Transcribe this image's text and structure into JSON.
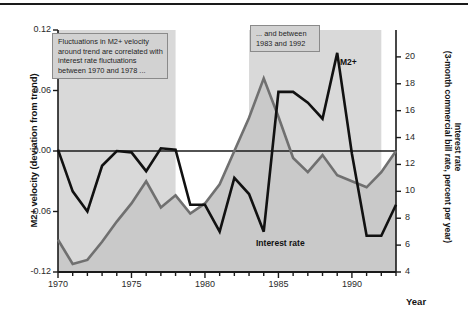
{
  "figure": {
    "x_axis_title": "Year",
    "y_axis_left_title": "M2+ velocity (deviation from trend)",
    "y_axis_right_title_line1": "Interest rate",
    "y_axis_right_title_line2": "(3-month commercial bill rate, percent per year)",
    "annotation_1": "Fluctuations in M2+ velocity around trend are correlated with interest rate fluctuations between 1970 and 1978 ...",
    "annotation_2": "... and between 1983 and 1992",
    "series_label_m2": "M2+",
    "series_label_interest": "Interest rate",
    "accent_m2_color": "#111111",
    "accent_interest_color": "#707070",
    "shade_band_color": "#d9d9d9",
    "area_fill_color": "#c9c9c9"
  },
  "chart_data": {
    "type": "line",
    "title": "",
    "xlabel": "Year",
    "ylabel": "M2+ velocity (deviation from trend)",
    "y2label": "Interest rate (3-month commercial bill rate, percent per year)",
    "xlim": [
      1970,
      1993
    ],
    "ylim": [
      -0.12,
      0.12
    ],
    "y2lim": [
      4,
      22
    ],
    "grid": false,
    "legend_position": "inline-annotations",
    "x_ticks": [
      1970,
      1975,
      1980,
      1985,
      1990
    ],
    "x_tick_labels": [
      "1970",
      "1975",
      "1980",
      "1985",
      "1990"
    ],
    "x_minor_tick_interval": 1,
    "y_ticks": [
      -0.12,
      -0.06,
      0.0,
      0.06,
      0.12
    ],
    "y_tick_labels": [
      "-0.12",
      "-0.06",
      "0.00",
      "0.06",
      "0.12"
    ],
    "y2_ticks": [
      4,
      6,
      8,
      10,
      12,
      14,
      16,
      18,
      20
    ],
    "y2_tick_labels": [
      "4",
      "6",
      "8",
      "10",
      "12",
      "14",
      "16",
      "18",
      "20"
    ],
    "zero_line_y": 0.0,
    "x": [
      1970,
      1971,
      1972,
      1973,
      1974,
      1975,
      1976,
      1977,
      1978,
      1979,
      1980,
      1981,
      1982,
      1983,
      1984,
      1985,
      1986,
      1987,
      1988,
      1989,
      1990,
      1991,
      1992,
      1993
    ],
    "series": [
      {
        "name": "M2+",
        "axis": "right",
        "units": "percent per year",
        "color": "#111111",
        "values": [
          13.1,
          10.0,
          8.5,
          11.9,
          13.0,
          12.9,
          11.5,
          13.2,
          13.1,
          9.0,
          9.0,
          7.0,
          11.0,
          9.8,
          7.0,
          17.4,
          17.4,
          16.6,
          15.4,
          20.3,
          12.8,
          6.7,
          6.7,
          9.0
        ]
      },
      {
        "name": "Interest rate",
        "axis": "left",
        "units": "deviation from trend",
        "color": "#707070",
        "values": [
          -0.088,
          -0.112,
          -0.108,
          -0.09,
          -0.07,
          -0.052,
          -0.03,
          -0.056,
          -0.044,
          -0.062,
          -0.052,
          -0.033,
          0.0,
          0.033,
          0.072,
          0.034,
          -0.007,
          -0.021,
          -0.004,
          -0.024,
          -0.03,
          -0.036,
          -0.021,
          0.0
        ]
      }
    ],
    "shaded_bands": [
      {
        "label": "1970-1978 correlated period",
        "x_start": 1970,
        "x_end": 1978
      },
      {
        "label": "1983-1992 correlated period",
        "x_start": 1983,
        "x_end": 1992
      }
    ]
  }
}
